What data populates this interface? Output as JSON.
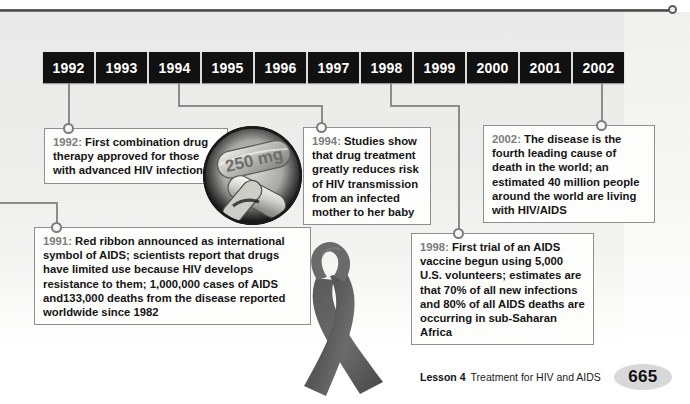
{
  "timeline": {
    "years": [
      "1992",
      "1993",
      "1994",
      "1995",
      "1996",
      "1997",
      "1998",
      "1999",
      "2000",
      "2001",
      "2002"
    ],
    "callouts": [
      {
        "id": "1991",
        "year_label": "1991:",
        "text": " Red ribbon announced as international symbol of AIDS; scientists report that drugs have limited use because HIV develops resistance to them; 1,000,000 cases of AIDS and133,000 deaths from the disease reported worldwide since 1982"
      },
      {
        "id": "1992",
        "year_label": "1992:",
        "text": " First combination drug therapy approved for those with advanced HIV infection"
      },
      {
        "id": "1994",
        "year_label": "1994:",
        "text": " Studies show that drug treatment greatly reduces risk of HIV transmission from an infected mother to her baby"
      },
      {
        "id": "1998",
        "year_label": "1998:",
        "text": " First trial of an AIDS vaccine begun using 5,000 U.S. volunteers; estimates are that 70% of all new infections and 80% of all AIDS deaths are occurring in sub-Saharan Africa"
      },
      {
        "id": "2002",
        "year_label": "2002:",
        "text": " The disease is the fourth leading cause of death in the world; an estimated 40 million people around the world are living with HIV/AIDS"
      }
    ],
    "images": {
      "pill_label": "250 mg",
      "pill_name": "capsule-photo",
      "ribbon_name": "awareness-ribbon"
    }
  },
  "footer": {
    "lesson": "Lesson 4",
    "title": "Treatment for HIV and AIDS",
    "page_number": "665"
  },
  "colors": {
    "year_bar_bg": "#111111",
    "year_text": "#ffffff",
    "callout_year": "#7d7d7d",
    "connector": "#8c8c8c",
    "page_badge": "#d8d8d8"
  }
}
